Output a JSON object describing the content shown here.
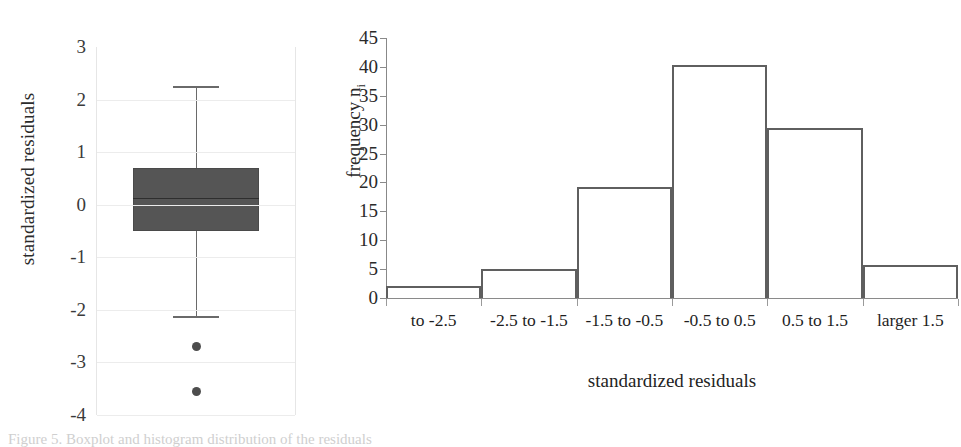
{
  "figure": {
    "caption": "Figure 5. Boxplot and histogram distribution of the residuals"
  },
  "boxplot": {
    "ylabel": "standardized residuals",
    "ytick_labels": [
      "3",
      "2",
      "1",
      "0",
      "-1",
      "-2",
      "-3",
      "-4"
    ]
  },
  "histogram": {
    "ylabel_main": "frequency n",
    "ylabel_sub": "i",
    "xlabel": "standardized residuals",
    "ytick_labels": [
      "45",
      "40",
      "35",
      "30",
      "25",
      "20",
      "15",
      "10",
      "5",
      "0"
    ],
    "xtick_labels": [
      "to -2.5",
      "-2.5 to -1.5",
      "-1.5 to -0.5",
      "-0.5 to 0.5",
      "0.5 to 1.5",
      "larger 1.5"
    ]
  },
  "chart_data": [
    {
      "type": "box",
      "title": "",
      "xlabel": "",
      "ylabel": "standardized residuals",
      "ylim": [
        -4,
        3
      ],
      "yticks": [
        -4,
        -3,
        -2,
        -1,
        0,
        1,
        2,
        3
      ],
      "grid": true,
      "legend": "none",
      "boxes": [
        {
          "name": "standardized residuals",
          "whisker_high": 2.25,
          "q3": 0.7,
          "median": 0.12,
          "q1": -0.5,
          "whisker_low": -2.12,
          "outliers": [
            -2.7,
            -3.55
          ]
        }
      ]
    },
    {
      "type": "bar",
      "title": "",
      "xlabel": "standardized residuals",
      "ylabel": "frequency n_i",
      "categories": [
        "to -2.5",
        "-2.5 to -1.5",
        "-1.5 to -0.5",
        "-0.5 to 0.5",
        "0.5 to 1.5",
        "larger 1.5"
      ],
      "values": [
        2,
        5,
        19.3,
        40.4,
        29.5,
        5.8
      ],
      "ylim": [
        0,
        45
      ],
      "yticks": [
        0,
        5,
        10,
        15,
        20,
        25,
        30,
        35,
        40,
        45
      ],
      "grid": false,
      "legend": "none"
    }
  ],
  "colors": {
    "box_fill": "#555555",
    "box_stroke": "#4a4a4a",
    "whisker": "#6a6a6a",
    "outlier": "#4d4d4d",
    "bar_stroke": "#5f5f5f",
    "axis": "#8a8a8a",
    "grid": "#ececec",
    "text": "#1a1a1a"
  }
}
